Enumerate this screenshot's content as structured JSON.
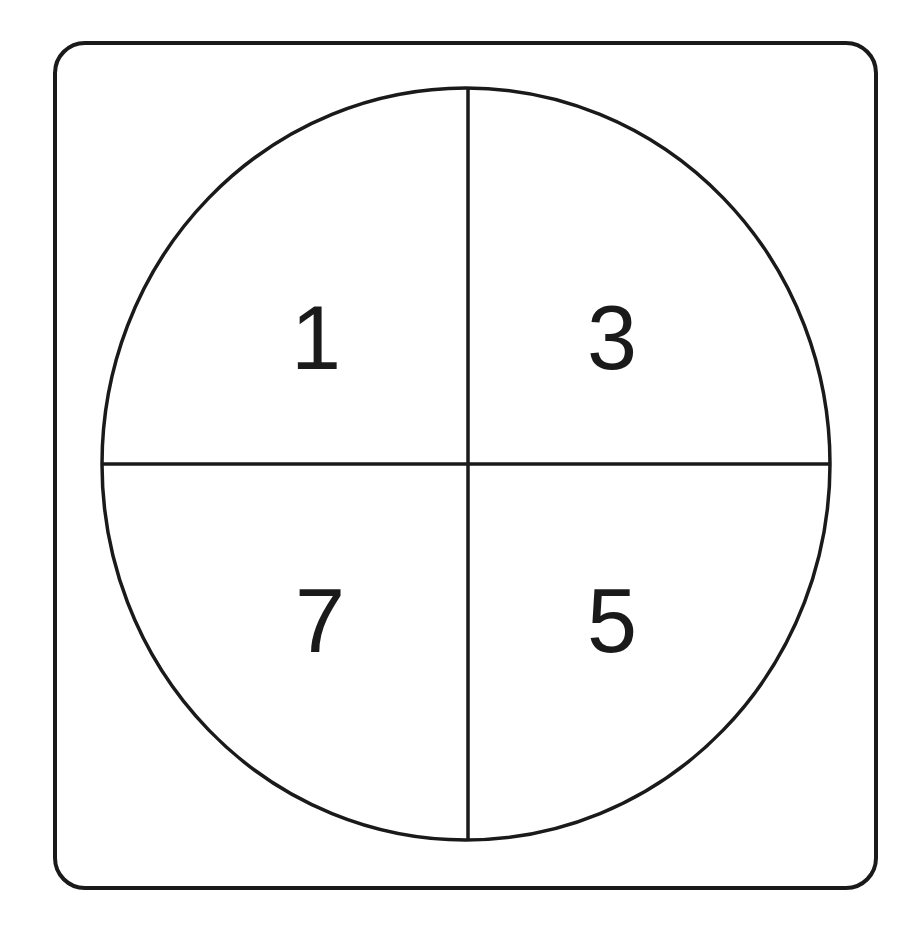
{
  "diagram": {
    "type": "circle-divided-into-quadrants",
    "frame": {
      "shape": "rounded-rectangle",
      "stroke": "#1a1a1a"
    },
    "circle": {
      "stroke": "#1a1a1a"
    },
    "quadrants": [
      {
        "position": "top-left",
        "label": "1"
      },
      {
        "position": "top-right",
        "label": "3"
      },
      {
        "position": "bottom-left",
        "label": "7"
      },
      {
        "position": "bottom-right",
        "label": "5"
      }
    ]
  }
}
